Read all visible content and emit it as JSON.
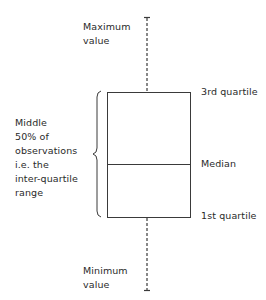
{
  "diagram": {
    "type": "box-plot-explainer",
    "labels": {
      "maximum": [
        "Maximum",
        "value"
      ],
      "minimum": [
        "Minimum",
        "value"
      ],
      "third_quartile": "3rd quartile",
      "median": "Median",
      "first_quartile": "1st quartile",
      "iqr": [
        "Middle",
        "50% of",
        "observations",
        "i.e. the",
        "inter-quartile",
        "range"
      ]
    },
    "colors": {
      "line": "#3a3a3a",
      "text": "#2a2a2a",
      "background": "#ffffff"
    }
  }
}
